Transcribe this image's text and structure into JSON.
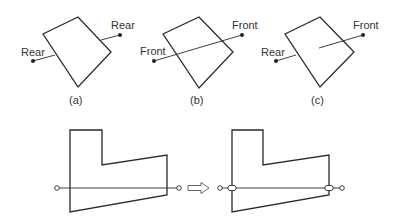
{
  "panels": [
    {
      "caption": "(a)",
      "left_label": "Rear",
      "right_label": "Rear"
    },
    {
      "caption": "(b)",
      "left_label": "Front",
      "right_label": "Front"
    },
    {
      "caption": "(c)",
      "left_label": "Rear",
      "right_label": "Front"
    }
  ],
  "colors": {
    "stroke": "#2a2a2a",
    "background": "#ffffff"
  }
}
